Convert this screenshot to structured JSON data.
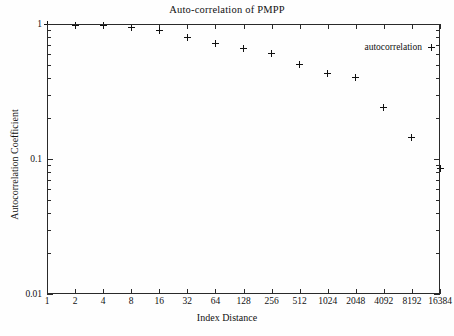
{
  "chart_data": {
    "type": "scatter",
    "title": "Auto-correlation of PMPP",
    "xlabel": "Index Distance",
    "ylabel": "Autocorrelation Coefficient",
    "xscale": "log2",
    "yscale": "log10",
    "xlim": [
      1,
      16384
    ],
    "ylim": [
      0.01,
      1
    ],
    "grid": false,
    "legend": {
      "entries": [
        {
          "name": "autocorrelation",
          "marker": "+"
        }
      ],
      "position": "top-right"
    },
    "xticks": [
      "1",
      "2",
      "4",
      "8",
      "16",
      "32",
      "64",
      "128",
      "256",
      "512",
      "1024",
      "2048",
      "4092",
      "8192",
      "16384"
    ],
    "yticks": [
      "1",
      "0.1",
      "0.01"
    ],
    "series": [
      {
        "name": "autocorrelation",
        "marker": "+",
        "color": "#111111",
        "x": [
          1,
          2,
          4,
          8,
          16,
          32,
          64,
          128,
          256,
          512,
          1024,
          2048,
          4092,
          8192,
          16384
        ],
        "y": [
          1.0,
          0.98,
          0.97,
          0.95,
          0.9,
          0.79,
          0.72,
          0.66,
          0.6,
          0.5,
          0.43,
          0.4,
          0.24,
          0.145,
          0.085
        ]
      }
    ]
  },
  "chart": {
    "title": "Auto-correlation of PMPP",
    "axis_titles": {
      "x": "Index Distance",
      "y": "Autocorrelation Coefficient"
    },
    "legend_label": "autocorrelation"
  }
}
